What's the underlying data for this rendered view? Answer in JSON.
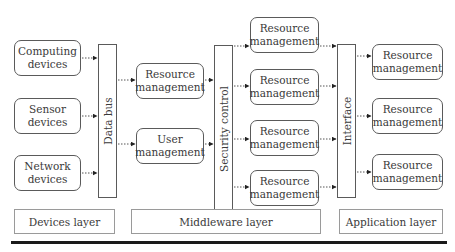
{
  "devices": [
    {
      "label_line1": "Computing",
      "label_line2": "devices"
    },
    {
      "label_line1": "Sensor",
      "label_line2": "devices"
    },
    {
      "label_line1": "Network",
      "label_line2": "devices"
    }
  ],
  "buses": {
    "data_bus": "Data bus",
    "security_control": "Security control",
    "interface": "Interface"
  },
  "middleware_left": [
    {
      "label_line1": "Resource",
      "label_line2": "management"
    },
    {
      "label_line1": "User",
      "label_line2": "management"
    }
  ],
  "middleware_right": [
    {
      "label_line1": "Resource",
      "label_line2": "management"
    },
    {
      "label_line1": "Resource",
      "label_line2": "management"
    },
    {
      "label_line1": "Resource",
      "label_line2": "management"
    },
    {
      "label_line1": "Resource",
      "label_line2": "management"
    }
  ],
  "application": [
    {
      "label_line1": "Resource",
      "label_line2": "management"
    },
    {
      "label_line1": "Resource",
      "label_line2": "management"
    },
    {
      "label_line1": "Resource",
      "label_line2": "management"
    }
  ],
  "layers": {
    "devices": "Devices layer",
    "middleware": "Middleware layer",
    "application": "Application layer"
  }
}
